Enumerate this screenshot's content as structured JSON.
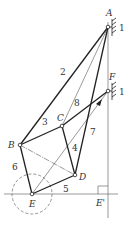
{
  "diagram": {
    "type": "mechanism-linkage",
    "points": {
      "A": {
        "label": "A",
        "x": 108,
        "y": 27
      },
      "F": {
        "label": "F",
        "x": 108,
        "y": 91
      },
      "B": {
        "label": "B",
        "x": 20,
        "y": 145
      },
      "C": {
        "label": "C",
        "x": 62,
        "y": 126
      },
      "D": {
        "label": "D",
        "x": 75,
        "y": 175
      },
      "E": {
        "label": "E",
        "x": 32,
        "y": 194
      },
      "E_prime": {
        "label": "E'",
        "x": 108,
        "y": 194
      }
    },
    "links": [
      {
        "id": "2",
        "from": "A",
        "to": "B",
        "label": "2"
      },
      {
        "id": "3",
        "from": "B",
        "to": "C",
        "label": "3"
      },
      {
        "id": "4",
        "from": "C",
        "to": "D",
        "label": "4"
      },
      {
        "id": "5",
        "from": "E",
        "to": "D",
        "label": "5"
      },
      {
        "id": "6",
        "from": "B",
        "to": "E",
        "label": "6"
      },
      {
        "id": "7",
        "from": "A",
        "to": "D",
        "label": "7"
      },
      {
        "id": "8",
        "from": "C",
        "to": "F",
        "label": "8"
      }
    ],
    "ground_labels": [
      "1",
      "1"
    ],
    "construction_lines": [
      "A-C",
      "E-F",
      "B-D",
      "A-E'",
      "horizontal through E"
    ],
    "circle": {
      "center": "E",
      "radius": 20,
      "style": "dashed"
    }
  }
}
